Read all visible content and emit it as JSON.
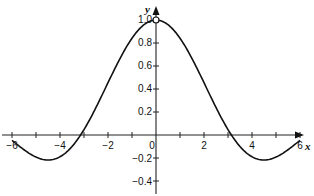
{
  "chart_data": {
    "type": "line",
    "title": "",
    "xlabel": "x",
    "ylabel": "y",
    "function": "sin(x)/x",
    "xlim": [
      -6.2,
      6.5
    ],
    "ylim": [
      -0.5,
      1.05
    ],
    "grid": false,
    "legend": null,
    "x_ticks": [
      -6,
      -5,
      -4,
      -3,
      -2,
      -1,
      0,
      1,
      2,
      3,
      4,
      5,
      6
    ],
    "x_tick_labels": [
      "-6",
      "-4",
      "-2",
      "0",
      "2",
      "4",
      "6"
    ],
    "y_ticks": [
      -0.4,
      -0.2,
      0.2,
      0.4,
      0.6,
      0.8,
      1.0
    ],
    "y_tick_labels": [
      "-0.4",
      "-0.2",
      "0.2",
      "0.4",
      "0.6",
      "0.8",
      "1.0"
    ],
    "annotations": [
      {
        "type": "open-circle",
        "x": 0,
        "y": 1.0
      }
    ],
    "series": [
      {
        "name": "y = sin(x)/x",
        "x": [
          -6,
          -5.5,
          -5,
          -4.5,
          -4,
          -3.5,
          -3,
          -2.5,
          -2,
          -1.5,
          -1,
          -0.5,
          0,
          0.5,
          1,
          1.5,
          2,
          2.5,
          3,
          3.5,
          4,
          4.5,
          5,
          5.5,
          6
        ],
        "values": [
          -0.047,
          -0.128,
          -0.192,
          -0.217,
          -0.189,
          -0.1,
          0.047,
          0.239,
          0.455,
          0.665,
          0.841,
          0.959,
          1.0,
          0.959,
          0.841,
          0.665,
          0.455,
          0.239,
          0.047,
          -0.1,
          -0.189,
          -0.217,
          -0.192,
          -0.128,
          -0.047
        ]
      }
    ]
  },
  "labels": {
    "x_axis": "x",
    "y_axis": "y",
    "ticks_x": {
      "m6": "−6",
      "m4": "−4",
      "m2": "−2",
      "zero": "0",
      "p2": "2",
      "p4": "4",
      "p6": "6"
    },
    "ticks_y": {
      "p10": "1.0",
      "p08": "0.8",
      "p06": "0.6",
      "p04": "0.4",
      "p02": "0.2",
      "m02": "−0.2",
      "m04": "−0.4"
    }
  }
}
